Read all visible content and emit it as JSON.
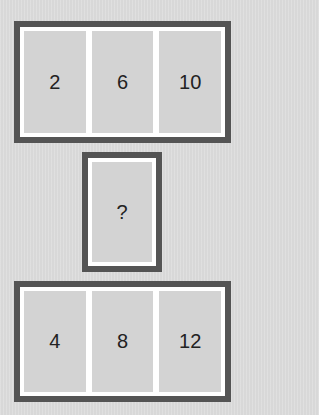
{
  "puzzle": {
    "top_row": {
      "cells": [
        "2",
        "6",
        "10"
      ]
    },
    "middle": {
      "cell": "?"
    },
    "bottom_row": {
      "cells": [
        "4",
        "8",
        "12"
      ]
    }
  },
  "colors": {
    "background": "#dcdcdc",
    "frame_border": "#545454",
    "frame_fill": "#ffffff",
    "cell_fill": "#d3d3d3",
    "text": "#222222"
  }
}
